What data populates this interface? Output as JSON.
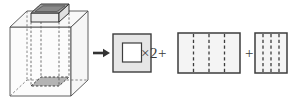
{
  "figure": {
    "background_color": "#ffffff"
  },
  "operators": {
    "times_two": "×2+",
    "plus": "+"
  },
  "arrow": {
    "name": "equals-arrow",
    "direction": "right",
    "color": "#333333"
  },
  "parts": [
    {
      "id": "solid",
      "label": "rectangular prism with square hole",
      "kind": "3d-solid",
      "outer_face_fill": "#fbfbfb",
      "top_face_fill": "#f2f2f2",
      "hole_fill": "#9a9a9a",
      "edge_color": "#4a4a4a",
      "hidden_edge_style": "dashed"
    },
    {
      "id": "square-with-hole",
      "label": "square face with square hole",
      "kind": "2d-face",
      "multiplier": "×2",
      "fill": "#e3e3e3",
      "hole_fill": "#ffffff",
      "border_color": "#3c3c3c"
    },
    {
      "id": "outer-lateral",
      "label": "outer lateral surface unrolled",
      "kind": "2d-rect",
      "fill": "#f3f3f3",
      "border_color": "#3c3c3c",
      "fold_line_style": "dashed",
      "fold_line_count": 3
    },
    {
      "id": "inner-lateral",
      "label": "inner hole lateral surface unrolled",
      "kind": "2d-rect",
      "fill": "#f3f3f3",
      "border_color": "#3c3c3c",
      "fold_line_style": "dashed",
      "fold_line_count": 3
    }
  ],
  "colors": {
    "stroke": "#3c3c3c",
    "light_fill": "#f3f3f3",
    "mid_fill": "#e3e3e3",
    "dark_fill": "#9a9a9a",
    "text": "#3a3a3a"
  }
}
